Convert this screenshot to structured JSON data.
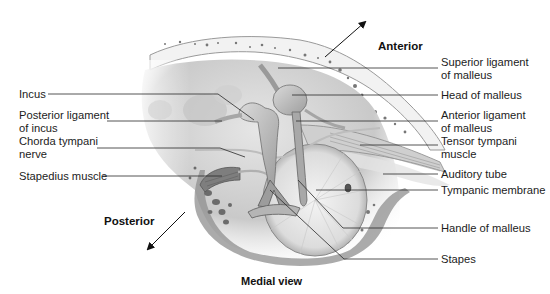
{
  "figure": {
    "caption": "Medial view",
    "orientation": {
      "anterior": "Anterior",
      "posterior": "Posterior"
    },
    "labels_left": [
      {
        "id": "incus",
        "lines": [
          "Incus"
        ]
      },
      {
        "id": "posterior-ligament-of-incus",
        "lines": [
          "Posterior ligament",
          "of incus"
        ]
      },
      {
        "id": "chorda-tympani-nerve",
        "lines": [
          "Chorda tympani",
          "nerve"
        ]
      },
      {
        "id": "stapedius-muscle",
        "lines": [
          "Stapedius muscle"
        ]
      }
    ],
    "labels_right": [
      {
        "id": "superior-ligament-of-malleus",
        "lines": [
          "Superior ligament",
          "of malleus"
        ]
      },
      {
        "id": "head-of-malleus",
        "lines": [
          "Head of malleus"
        ]
      },
      {
        "id": "anterior-ligament-of-malleus",
        "lines": [
          "Anterior ligament",
          "of malleus"
        ]
      },
      {
        "id": "tensor-tympani-muscle",
        "lines": [
          "Tensor tympani",
          "muscle"
        ]
      },
      {
        "id": "auditory-tube",
        "lines": [
          "Auditory tube"
        ]
      },
      {
        "id": "tympanic-membrane",
        "lines": [
          "Tympanic membrane"
        ]
      },
      {
        "id": "handle-of-malleus",
        "lines": [
          "Handle of malleus"
        ]
      },
      {
        "id": "stapes",
        "lines": [
          "Stapes"
        ]
      }
    ]
  }
}
